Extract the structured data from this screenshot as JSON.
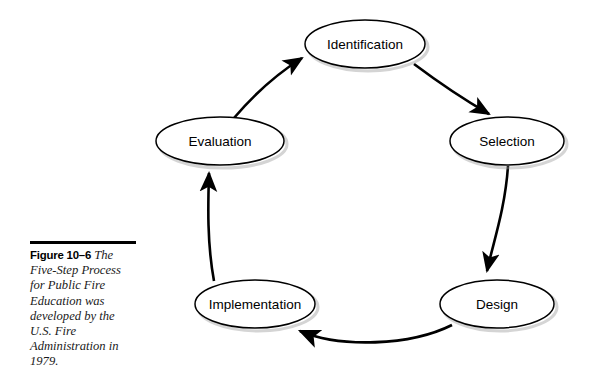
{
  "figure": {
    "caption_number": "Figure 10–6",
    "caption_text": "The Five-Step Process for Public Fire Education was developed by the U.S. Fire Administration in 1979.",
    "colors": {
      "node_fill": "#ffffff",
      "node_stroke": "#000000",
      "shadow": "#b8b8b8",
      "arrow": "#000000",
      "caption_text": "#1a1a1a",
      "background": "#ffffff"
    }
  },
  "diagram": {
    "type": "cycle",
    "direction": "clockwise",
    "step_count": 5,
    "nodes": [
      {
        "id": "identification",
        "label": "Identification",
        "cx": 365,
        "cy": 44,
        "rx": 60,
        "ry": 24
      },
      {
        "id": "selection",
        "label": "Selection",
        "cx": 507,
        "cy": 141,
        "rx": 57,
        "ry": 24
      },
      {
        "id": "design",
        "label": "Design",
        "cx": 497,
        "cy": 304,
        "rx": 57,
        "ry": 24
      },
      {
        "id": "implementation",
        "label": "Implementation",
        "cx": 255,
        "cy": 304,
        "rx": 60,
        "ry": 24
      },
      {
        "id": "evaluation",
        "label": "Evaluation",
        "cx": 220,
        "cy": 141,
        "rx": 64,
        "ry": 24
      }
    ],
    "edges": [
      {
        "id": "identification-to-selection",
        "from": "identification",
        "to": "selection"
      },
      {
        "id": "selection-to-design",
        "from": "selection",
        "to": "design"
      },
      {
        "id": "design-to-implementation",
        "from": "design",
        "to": "implementation"
      },
      {
        "id": "implementation-to-evaluation",
        "from": "implementation",
        "to": "evaluation"
      },
      {
        "id": "evaluation-to-identification",
        "from": "evaluation",
        "to": "identification"
      }
    ]
  }
}
